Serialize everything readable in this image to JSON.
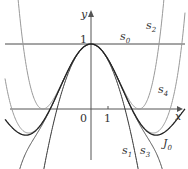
{
  "chart_data": {
    "type": "line",
    "xlabel": "x",
    "ylabel": "y",
    "ticks": {
      "x": [
        "0",
        "1"
      ],
      "y": [
        "1"
      ]
    },
    "series": [
      {
        "name": "s0",
        "formula": "1",
        "color": "#333333"
      },
      {
        "name": "s1",
        "formula": "1 - x^2/4",
        "color": "#333333"
      },
      {
        "name": "s2",
        "formula": "1 - x^2/4 + x^4/64",
        "color": "#999999"
      },
      {
        "name": "s3",
        "formula": "1 - x^2/4 + x^4/64 - x^6/2304",
        "color": "#555555"
      },
      {
        "name": "s4",
        "formula": "1 - x^2/4 + x^4/64 - x^6/2304 + x^8/147456",
        "color": "#999999"
      },
      {
        "name": "J0",
        "formula": "Bessel J0(x)",
        "color": "#222222"
      }
    ],
    "xlim": [
      -5.3,
      5.5
    ],
    "ylim": [
      -0.9,
      1.5
    ]
  },
  "labels": {
    "y": "y",
    "x": "x",
    "one_y": "1",
    "zero": "0",
    "one_x": "1",
    "s0": "s",
    "s0_sub": "0",
    "s1": "s",
    "s1_sub": "1",
    "s2": "s",
    "s2_sub": "2",
    "s3": "s",
    "s3_sub": "3",
    "s4": "s",
    "s4_sub": "4",
    "J0": "J",
    "J0_sub": "0"
  }
}
